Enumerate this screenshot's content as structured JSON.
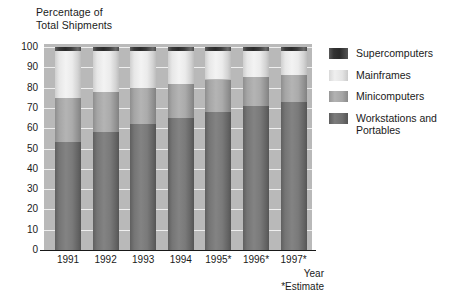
{
  "chart_data": {
    "type": "bar",
    "subtype": "stacked-100-percent",
    "title": "",
    "ylabel": "Percentage of\nTotal Shipments",
    "xlabel": "Year",
    "footnote": "*Estimate",
    "categories": [
      "1991",
      "1992",
      "1993",
      "1994",
      "1995*",
      "1996*",
      "1997*"
    ],
    "ylim": [
      0,
      100
    ],
    "yticks": [
      0,
      10,
      20,
      30,
      40,
      50,
      60,
      70,
      80,
      90,
      100
    ],
    "grid": true,
    "legend_position": "right",
    "series": [
      {
        "name": "Workstations and Portables",
        "color": "#7a7a7a",
        "values": [
          53,
          58,
          62,
          65,
          68,
          71,
          73
        ]
      },
      {
        "name": "Minicomputers",
        "color": "#ababab",
        "values": [
          22,
          20,
          18,
          17,
          16,
          14,
          13
        ]
      },
      {
        "name": "Mainframes",
        "color": "#ededed",
        "values": [
          23,
          20,
          18,
          16,
          14,
          13,
          12
        ]
      },
      {
        "name": "Supercomputers",
        "color": "#303030",
        "values": [
          2,
          2,
          2,
          2,
          2,
          2,
          2
        ]
      }
    ],
    "cumulative_tops": {
      "workstations": [
        53,
        58,
        62,
        65,
        68,
        71,
        73
      ],
      "minicomputers": [
        75,
        78,
        80,
        82,
        84,
        85,
        86
      ],
      "mainframes": [
        98,
        98,
        98,
        98,
        98,
        98,
        98
      ],
      "supercomputers": [
        100,
        100,
        100,
        100,
        100,
        100,
        100
      ]
    },
    "plot_background": "#b9b9b9",
    "gridline_color": "#efefef"
  },
  "legend": {
    "entries": [
      {
        "label": "Supercomputers",
        "key": "super"
      },
      {
        "label": "Mainframes",
        "key": "main"
      },
      {
        "label": "Minicomputers",
        "key": "mini"
      },
      {
        "label": "Workstations and\nPortables",
        "key": "work"
      }
    ]
  },
  "axis": {
    "y_title": "Percentage of\nTotal Shipments",
    "x_title": "Year",
    "footnote": "*Estimate"
  }
}
